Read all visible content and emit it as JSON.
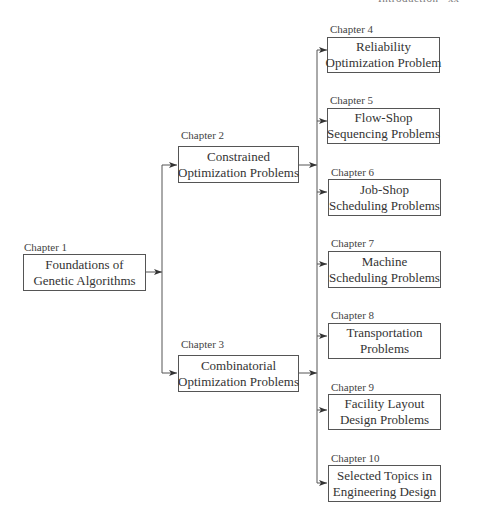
{
  "header": {
    "running_title": "Introduction",
    "page_number": "xx"
  },
  "diagram": {
    "nodes": [
      {
        "id": "ch1",
        "chapter": "Chapter 1",
        "line1": "Foundations of",
        "line2": "Genetic Algorithms"
      },
      {
        "id": "ch2",
        "chapter": "Chapter 2",
        "line1": "Constrained",
        "line2": "Optimization Problems"
      },
      {
        "id": "ch3",
        "chapter": "Chapter 3",
        "line1": "Combinatorial",
        "line2": "Optimization Problems"
      },
      {
        "id": "ch4",
        "chapter": "Chapter 4",
        "line1": "Reliability",
        "line2": "Optimization Problem"
      },
      {
        "id": "ch5",
        "chapter": "Chapter 5",
        "line1": "Flow-Shop",
        "line2": "Sequencing Problems"
      },
      {
        "id": "ch6",
        "chapter": "Chapter 6",
        "line1": "Job-Shop",
        "line2": "Scheduling Problems"
      },
      {
        "id": "ch7",
        "chapter": "Chapter 7",
        "line1": "Machine",
        "line2": "Scheduling Problems"
      },
      {
        "id": "ch8",
        "chapter": "Chapter 8",
        "line1": "Transportation",
        "line2": "Problems"
      },
      {
        "id": "ch9",
        "chapter": "Chapter 9",
        "line1": "Facility Layout",
        "line2": "Design Problems"
      },
      {
        "id": "ch10",
        "chapter": "Chapter 10",
        "line1": "Selected Topics in",
        "line2": "Engineering Design"
      }
    ],
    "edges": [
      [
        "ch1",
        "ch2"
      ],
      [
        "ch1",
        "ch3"
      ],
      [
        "ch2",
        "ch4"
      ],
      [
        "ch2",
        "ch5"
      ],
      [
        "ch2",
        "ch6"
      ],
      [
        "ch2",
        "ch7"
      ],
      [
        "ch2",
        "ch8"
      ],
      [
        "ch2",
        "ch9"
      ],
      [
        "ch2",
        "ch10"
      ],
      [
        "ch3",
        "ch4"
      ],
      [
        "ch3",
        "ch5"
      ],
      [
        "ch3",
        "ch6"
      ],
      [
        "ch3",
        "ch7"
      ],
      [
        "ch3",
        "ch8"
      ],
      [
        "ch3",
        "ch9"
      ],
      [
        "ch3",
        "ch10"
      ]
    ]
  }
}
